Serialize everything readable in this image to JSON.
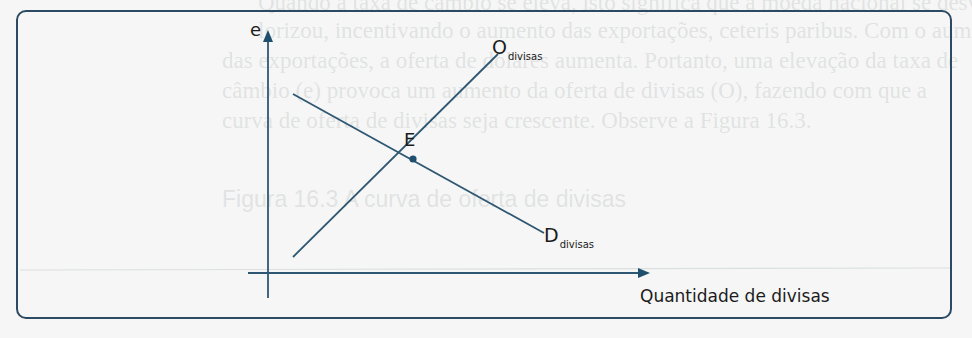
{
  "figure": {
    "type": "supply-demand-diagram",
    "frame_color": "#2c4a63",
    "line_color": "#2e5773",
    "point_color": "#1f4f6e",
    "axes": {
      "y_label": "e",
      "x_label": "Quantidade de divisas"
    },
    "curves": [
      {
        "name": "supply",
        "label_main": "O",
        "label_sub": "divisas",
        "slope": "positive",
        "from": [
          293,
          257
        ],
        "to": [
          498,
          54
        ]
      },
      {
        "name": "demand",
        "label_main": "D",
        "label_sub": "divisas",
        "slope": "negative",
        "from": [
          293,
          94
        ],
        "to": [
          544,
          233
        ]
      }
    ],
    "equilibrium": {
      "label": "E",
      "x": 413,
      "y": 159
    }
  },
  "background_bleed_text": [
    "Quando a taxa de câmbio se eleva, isto significa que a moeda nacional se desva-",
    "lorizou, incentivando o aumento das exportações, ceteris paribus. Com o aumento",
    "das exportações, a oferta de dólares aumenta. Portanto, uma elevação da taxa de",
    "câmbio (e) provoca um aumento da oferta de divisas (O), fazendo com que a",
    "curva de oferta de divisas seja crescente. Observe a Figura 16.3.",
    "Figura 16.3    A curva de oferta de divisas"
  ]
}
